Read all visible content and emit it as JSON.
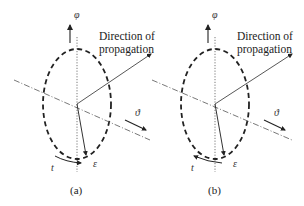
{
  "figure": {
    "panels": [
      {
        "id": "a",
        "caption": "(a)",
        "propagation_label_line1": "Direction of",
        "propagation_label_line2": "propagation",
        "phi_symbol": "φ",
        "theta_symbol": "ϑ",
        "e_symbol": "ε",
        "t_symbol": "t",
        "rotation_direction": "clockwise"
      },
      {
        "id": "b",
        "caption": "(b)",
        "propagation_label_line1": "Direction of",
        "propagation_label_line2": "propagation",
        "phi_symbol": "φ",
        "theta_symbol": "ϑ",
        "e_symbol": "ε",
        "t_symbol": "t",
        "rotation_direction": "counter-clockwise"
      }
    ],
    "colors": {
      "line": "#222222",
      "axis": "#444444",
      "background": "#ffffff"
    }
  }
}
